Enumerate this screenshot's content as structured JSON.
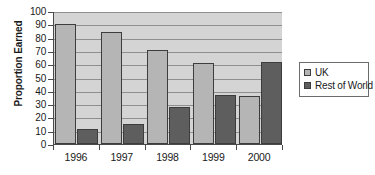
{
  "chart_data": {
    "type": "bar",
    "title": "",
    "xlabel": "",
    "ylabel": "Proportion Earned",
    "categories": [
      "1996",
      "1997",
      "1998",
      "1999",
      "2000"
    ],
    "series": [
      {
        "name": "UK",
        "color": "#b5b5b5",
        "values": [
          90,
          84,
          71,
          61,
          36
        ]
      },
      {
        "name": "Rest of World",
        "color": "#5e5e5e",
        "values": [
          11,
          15,
          28,
          37,
          62
        ]
      }
    ],
    "ylim": [
      0,
      100
    ],
    "ytick_step": 10,
    "yticks": [
      0,
      10,
      20,
      30,
      40,
      50,
      60,
      70,
      80,
      90,
      100
    ],
    "ytick_labels": [
      "0",
      "10",
      "20",
      "30",
      "40",
      "50",
      "60",
      "70",
      "80",
      "90",
      "100"
    ],
    "grid": true,
    "grid_axis": "y",
    "legend_position": "right",
    "plot_background": "#d4d4d4"
  },
  "legend": {
    "entries": [
      {
        "label": "UK"
      },
      {
        "label": "Rest of World"
      }
    ]
  }
}
